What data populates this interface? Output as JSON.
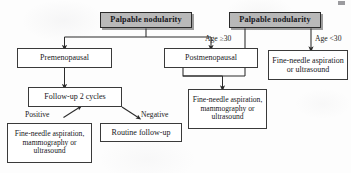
{
  "diagram": {
    "background_color": "#fdfdfd",
    "header_fill": "#b9b9b9",
    "line_color": "#2b2b2b",
    "text_color": "#17171c",
    "nodes": {
      "left_root": "Palpable nodularity",
      "right_root": "Palpable nodularity",
      "premenopausal": "Premenopausal",
      "postmenopausal": "Postmenopausal",
      "followup_cycles": "Follow-up 2 cycles",
      "fna_left_line1": "Fine-needle aspiration,",
      "fna_left_line2": "mammography or",
      "fna_left_line3": "ultrasound",
      "routine_followup": "Routine follow-up",
      "fna_mid_line1": "Fine-needle aspiration,",
      "fna_mid_line2": "mammography or",
      "fna_mid_line3": "ultrasound",
      "fna_right_line1": "Fine-needle aspiration",
      "fna_right_line2": "or ultrasound"
    },
    "edge_labels": {
      "age_ge_30": "Age ≥30",
      "age_lt_30": "Age <30",
      "positive": "Positive",
      "negative": "Negative"
    }
  }
}
